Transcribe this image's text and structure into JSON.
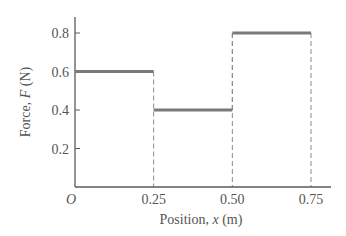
{
  "chart_data": {
    "type": "step",
    "title": "",
    "xlabel": "Position, x (m)",
    "ylabel": "Force, F (N)",
    "xlabel_parts": {
      "prefix": "Position, ",
      "var": "x",
      "suffix": " (m)"
    },
    "ylabel_parts": {
      "prefix": "Force, ",
      "var": "F",
      "suffix": " (N)"
    },
    "origin_label": "O",
    "x_ticks": [
      {
        "value": 0.25,
        "label": "0.25"
      },
      {
        "value": 0.5,
        "label": "0.50"
      },
      {
        "value": 0.75,
        "label": "0.75"
      }
    ],
    "y_ticks": [
      {
        "value": 0.2,
        "label": "0.2"
      },
      {
        "value": 0.4,
        "label": "0.4"
      },
      {
        "value": 0.6,
        "label": "0.6"
      },
      {
        "value": 0.8,
        "label": "0.8"
      }
    ],
    "xlim": [
      0,
      0.8
    ],
    "ylim": [
      0,
      0.88
    ],
    "grid": false,
    "segments": [
      {
        "x_start": 0.0,
        "x_end": 0.25,
        "force": 0.6
      },
      {
        "x_start": 0.25,
        "x_end": 0.5,
        "force": 0.4
      },
      {
        "x_start": 0.5,
        "x_end": 0.75,
        "force": 0.8
      }
    ],
    "colors": {
      "axis": "#5a5a5a",
      "segment": "#7a7a7a",
      "dashed": "#8a8a8a",
      "text": "#555555"
    }
  }
}
